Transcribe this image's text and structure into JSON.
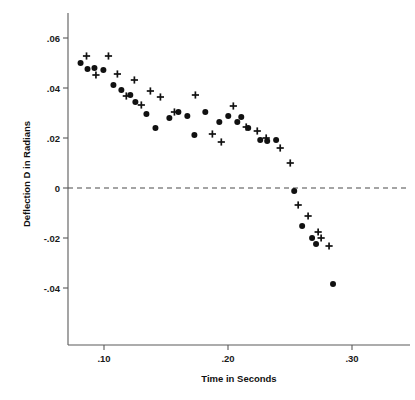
{
  "chart_data": {
    "type": "scatter",
    "title": "",
    "xlabel": "Time in Seconds",
    "ylabel": "Deflection D in Radians",
    "xlim": [
      0.071,
      0.337
    ],
    "ylim": [
      -0.062,
      0.068
    ],
    "xticks": [
      0.1,
      0.2,
      0.3
    ],
    "xticklabels": [
      ".10",
      ".20",
      ".30"
    ],
    "yticks": [
      0.06,
      0.04,
      0.02,
      0,
      -0.02,
      -0.04
    ],
    "yticklabels": [
      ".06",
      ".04",
      ".02",
      "0",
      "-.02",
      "-.04"
    ],
    "grid": false,
    "legend": null,
    "annotations": [
      {
        "name": "zero-reference-line",
        "type": "hline",
        "y": 0,
        "style": "dashed"
      }
    ],
    "series": [
      {
        "name": "filled-circles",
        "marker": "circle",
        "color": "#111111",
        "points": [
          [
            0.0811,
            0.05
          ],
          [
            0.0867,
            0.0476
          ],
          [
            0.0923,
            0.048
          ],
          [
            0.0995,
            0.0472
          ],
          [
            0.1076,
            0.0412
          ],
          [
            0.114,
            0.0392
          ],
          [
            0.1212,
            0.0372
          ],
          [
            0.1253,
            0.0344
          ],
          [
            0.1342,
            0.0296
          ],
          [
            0.1415,
            0.024
          ],
          [
            0.1527,
            0.028
          ],
          [
            0.16,
            0.0304
          ],
          [
            0.1672,
            0.0288
          ],
          [
            0.1729,
            0.0212
          ],
          [
            0.1817,
            0.0304
          ],
          [
            0.193,
            0.0264
          ],
          [
            0.2002,
            0.0288
          ],
          [
            0.2075,
            0.0264
          ],
          [
            0.2107,
            0.0284
          ],
          [
            0.2163,
            0.024
          ],
          [
            0.226,
            0.0192
          ],
          [
            0.2316,
            0.0188
          ],
          [
            0.2388,
            0.0192
          ],
          [
            0.2534,
            -0.0012
          ],
          [
            0.2598,
            -0.0152
          ],
          [
            0.2678,
            -0.02
          ],
          [
            0.271,
            -0.0224
          ],
          [
            0.2847,
            -0.0384
          ]
        ]
      },
      {
        "name": "plus-crosses",
        "marker": "plus",
        "color": "#111111",
        "points": [
          [
            0.0859,
            0.0528
          ],
          [
            0.0935,
            0.0452
          ],
          [
            0.1036,
            0.0528
          ],
          [
            0.1108,
            0.0456
          ],
          [
            0.118,
            0.0368
          ],
          [
            0.1245,
            0.0432
          ],
          [
            0.1301,
            0.0332
          ],
          [
            0.1374,
            0.0388
          ],
          [
            0.1455,
            0.0364
          ],
          [
            0.1568,
            0.0304
          ],
          [
            0.1737,
            0.0372
          ],
          [
            0.1874,
            0.0216
          ],
          [
            0.1946,
            0.0184
          ],
          [
            0.2043,
            0.0328
          ],
          [
            0.2147,
            0.0244
          ],
          [
            0.2236,
            0.0228
          ],
          [
            0.2308,
            0.02
          ],
          [
            0.2421,
            0.016
          ],
          [
            0.2502,
            0.01
          ],
          [
            0.2566,
            -0.0068
          ],
          [
            0.2646,
            -0.0112
          ],
          [
            0.2727,
            -0.0176
          ],
          [
            0.2751,
            -0.02
          ],
          [
            0.2815,
            -0.0232
          ]
        ]
      }
    ]
  },
  "axes": {
    "y_title": "Deflection D in Radians",
    "x_title": "Time in Seconds",
    "y_labels": [
      ".06",
      ".04",
      ".02",
      "0",
      "-.02",
      "-.04"
    ],
    "x_labels": [
      ".10",
      ".20",
      ".30"
    ]
  },
  "colors": {
    "marker": "#111111",
    "axis": "#5a5a5a",
    "zero_line": "#4a4a4a",
    "background": "#ffffff"
  }
}
